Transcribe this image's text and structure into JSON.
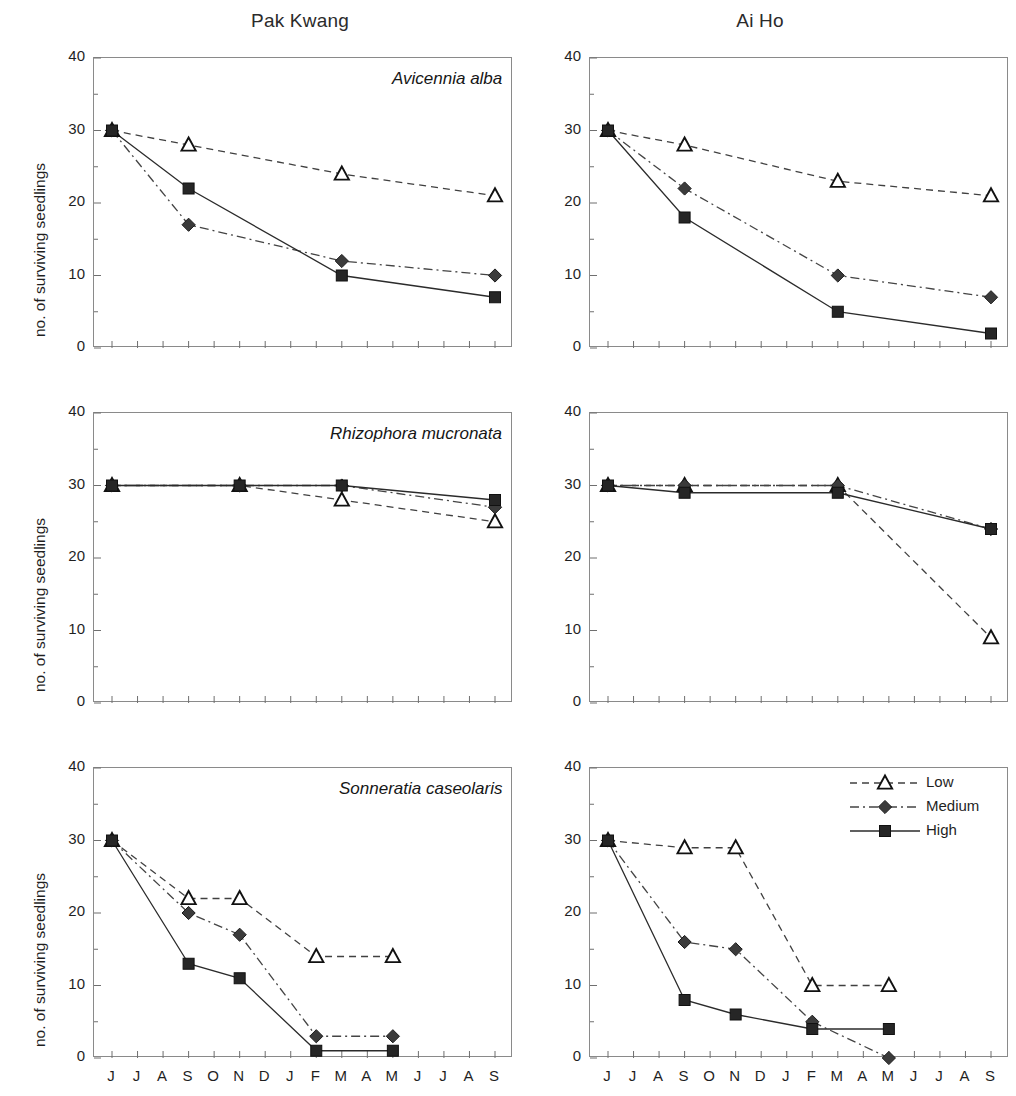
{
  "figure": {
    "ylabel": "no. of surviving seedlings",
    "columns": [
      {
        "key": "pak_kwang",
        "title": "Pak Kwang"
      },
      {
        "key": "ai_ho",
        "title": "Ai Ho"
      }
    ],
    "rows": [
      {
        "key": "avicennia",
        "species": "Avicennia alba"
      },
      {
        "key": "rhizophora",
        "species": "Rhizophora mucronata"
      },
      {
        "key": "sonneratia",
        "species": "Sonneratia caseolaris"
      }
    ],
    "y_ticks": [
      "0",
      "10",
      "20",
      "30",
      "40"
    ],
    "x_ticks": [
      "J",
      "J",
      "A",
      "S",
      "O",
      "N",
      "D",
      "J",
      "F",
      "M",
      "A",
      "M",
      "J",
      "J",
      "A",
      "S"
    ],
    "year_labels": [
      {
        "text": "1999",
        "month_index": 0
      },
      {
        "text": "2000",
        "month_index": 7
      }
    ],
    "legend": {
      "position": "top-right of bottom-right panel",
      "items": [
        {
          "label": "Low",
          "marker": "triangle-open",
          "line": "dashed",
          "color": "#3a3a3a"
        },
        {
          "label": "Medium",
          "marker": "diamond-filled",
          "line": "dash-dot",
          "color": "#3f3f3f"
        },
        {
          "label": "High",
          "marker": "square-filled",
          "line": "solid",
          "color": "#2a2a2a"
        }
      ]
    }
  },
  "chart_data": [
    {
      "type": "line",
      "id": "pak_kwang-avicennia",
      "title": "Avicennia alba",
      "panel_title": "Pak Kwang",
      "xlabel": "",
      "ylabel": "no. of surviving seedlings",
      "ylim": [
        0,
        40
      ],
      "yticks": [
        0,
        10,
        20,
        30,
        40
      ],
      "x": [
        "J",
        "J",
        "A",
        "S",
        "O",
        "N",
        "D",
        "J",
        "F",
        "M",
        "A",
        "M",
        "J",
        "J",
        "A",
        "S"
      ],
      "grid": false,
      "series": [
        {
          "name": "Low",
          "points": [
            {
              "x": 0,
              "y": 30
            },
            {
              "x": 3,
              "y": 28
            },
            {
              "x": 9,
              "y": 24
            },
            {
              "x": 15,
              "y": 21
            }
          ]
        },
        {
          "name": "Medium",
          "points": [
            {
              "x": 0,
              "y": 30
            },
            {
              "x": 3,
              "y": 17
            },
            {
              "x": 9,
              "y": 12
            },
            {
              "x": 15,
              "y": 10
            }
          ]
        },
        {
          "name": "High",
          "points": [
            {
              "x": 0,
              "y": 30
            },
            {
              "x": 3,
              "y": 22
            },
            {
              "x": 9,
              "y": 10
            },
            {
              "x": 15,
              "y": 7
            }
          ]
        }
      ]
    },
    {
      "type": "line",
      "id": "ai_ho-avicennia",
      "title": "",
      "panel_title": "Ai Ho",
      "xlabel": "",
      "ylabel": "no. of surviving seedlings",
      "ylim": [
        0,
        40
      ],
      "yticks": [
        0,
        10,
        20,
        30,
        40
      ],
      "x": [
        "J",
        "J",
        "A",
        "S",
        "O",
        "N",
        "D",
        "J",
        "F",
        "M",
        "A",
        "M",
        "J",
        "J",
        "A",
        "S"
      ],
      "grid": false,
      "series": [
        {
          "name": "Low",
          "points": [
            {
              "x": 0,
              "y": 30
            },
            {
              "x": 3,
              "y": 28
            },
            {
              "x": 9,
              "y": 23
            },
            {
              "x": 15,
              "y": 21
            }
          ]
        },
        {
          "name": "Medium",
          "points": [
            {
              "x": 0,
              "y": 30
            },
            {
              "x": 3,
              "y": 22
            },
            {
              "x": 9,
              "y": 10
            },
            {
              "x": 15,
              "y": 7
            }
          ]
        },
        {
          "name": "High",
          "points": [
            {
              "x": 0,
              "y": 30
            },
            {
              "x": 3,
              "y": 18
            },
            {
              "x": 9,
              "y": 5
            },
            {
              "x": 15,
              "y": 2
            }
          ]
        }
      ]
    },
    {
      "type": "line",
      "id": "pak_kwang-rhizophora",
      "title": "Rhizophora mucronata",
      "panel_title": "Pak Kwang",
      "xlabel": "",
      "ylabel": "no. of surviving seedlings",
      "ylim": [
        0,
        40
      ],
      "yticks": [
        0,
        10,
        20,
        30,
        40
      ],
      "x": [
        "J",
        "J",
        "A",
        "S",
        "O",
        "N",
        "D",
        "J",
        "F",
        "M",
        "A",
        "M",
        "J",
        "J",
        "A",
        "S"
      ],
      "grid": false,
      "series": [
        {
          "name": "Low",
          "points": [
            {
              "x": 0,
              "y": 30
            },
            {
              "x": 5,
              "y": 30
            },
            {
              "x": 9,
              "y": 28
            },
            {
              "x": 15,
              "y": 25
            }
          ]
        },
        {
          "name": "Medium",
          "points": [
            {
              "x": 0,
              "y": 30
            },
            {
              "x": 5,
              "y": 30
            },
            {
              "x": 9,
              "y": 30
            },
            {
              "x": 15,
              "y": 27
            }
          ]
        },
        {
          "name": "High",
          "points": [
            {
              "x": 0,
              "y": 30
            },
            {
              "x": 5,
              "y": 30
            },
            {
              "x": 9,
              "y": 30
            },
            {
              "x": 15,
              "y": 28
            }
          ]
        }
      ]
    },
    {
      "type": "line",
      "id": "ai_ho-rhizophora",
      "title": "",
      "panel_title": "Ai Ho",
      "xlabel": "",
      "ylabel": "no. of surviving seedlings",
      "ylim": [
        0,
        40
      ],
      "yticks": [
        0,
        10,
        20,
        30,
        40
      ],
      "x": [
        "J",
        "J",
        "A",
        "S",
        "O",
        "N",
        "D",
        "J",
        "F",
        "M",
        "A",
        "M",
        "J",
        "J",
        "A",
        "S"
      ],
      "grid": false,
      "series": [
        {
          "name": "Low",
          "points": [
            {
              "x": 0,
              "y": 30
            },
            {
              "x": 3,
              "y": 30
            },
            {
              "x": 9,
              "y": 30
            },
            {
              "x": 15,
              "y": 9
            }
          ]
        },
        {
          "name": "Medium",
          "points": [
            {
              "x": 0,
              "y": 30
            },
            {
              "x": 3,
              "y": 30
            },
            {
              "x": 9,
              "y": 30
            },
            {
              "x": 15,
              "y": 24
            }
          ]
        },
        {
          "name": "High",
          "points": [
            {
              "x": 0,
              "y": 30
            },
            {
              "x": 3,
              "y": 29
            },
            {
              "x": 9,
              "y": 29
            },
            {
              "x": 15,
              "y": 24
            }
          ]
        }
      ]
    },
    {
      "type": "line",
      "id": "pak_kwang-sonneratia",
      "title": "Sonneratia caseolaris",
      "panel_title": "Pak Kwang",
      "xlabel": "",
      "ylabel": "no. of surviving seedlings",
      "ylim": [
        0,
        40
      ],
      "yticks": [
        0,
        10,
        20,
        30,
        40
      ],
      "x": [
        "J",
        "J",
        "A",
        "S",
        "O",
        "N",
        "D",
        "J",
        "F",
        "M",
        "A",
        "M",
        "J",
        "J",
        "A",
        "S"
      ],
      "grid": false,
      "series": [
        {
          "name": "Low",
          "points": [
            {
              "x": 0,
              "y": 30
            },
            {
              "x": 3,
              "y": 22
            },
            {
              "x": 5,
              "y": 22
            },
            {
              "x": 8,
              "y": 14
            },
            {
              "x": 11,
              "y": 14
            }
          ]
        },
        {
          "name": "Medium",
          "points": [
            {
              "x": 0,
              "y": 30
            },
            {
              "x": 3,
              "y": 20
            },
            {
              "x": 5,
              "y": 17
            },
            {
              "x": 8,
              "y": 3
            },
            {
              "x": 11,
              "y": 3
            }
          ]
        },
        {
          "name": "High",
          "points": [
            {
              "x": 0,
              "y": 30
            },
            {
              "x": 3,
              "y": 13
            },
            {
              "x": 5,
              "y": 11
            },
            {
              "x": 8,
              "y": 1
            },
            {
              "x": 11,
              "y": 1
            }
          ]
        }
      ]
    },
    {
      "type": "line",
      "id": "ai_ho-sonneratia",
      "title": "",
      "panel_title": "Ai Ho",
      "xlabel": "",
      "ylabel": "no. of surviving seedlings",
      "ylim": [
        0,
        40
      ],
      "yticks": [
        0,
        10,
        20,
        30,
        40
      ],
      "x": [
        "J",
        "J",
        "A",
        "S",
        "O",
        "N",
        "D",
        "J",
        "F",
        "M",
        "A",
        "M",
        "J",
        "J",
        "A",
        "S"
      ],
      "grid": false,
      "series": [
        {
          "name": "Low",
          "points": [
            {
              "x": 0,
              "y": 30
            },
            {
              "x": 3,
              "y": 29
            },
            {
              "x": 5,
              "y": 29
            },
            {
              "x": 8,
              "y": 10
            },
            {
              "x": 11,
              "y": 10
            }
          ]
        },
        {
          "name": "Medium",
          "points": [
            {
              "x": 0,
              "y": 30
            },
            {
              "x": 3,
              "y": 16
            },
            {
              "x": 5,
              "y": 15
            },
            {
              "x": 8,
              "y": 5
            },
            {
              "x": 11,
              "y": 0
            }
          ]
        },
        {
          "name": "High",
          "points": [
            {
              "x": 0,
              "y": 30
            },
            {
              "x": 3,
              "y": 8
            },
            {
              "x": 5,
              "y": 6
            },
            {
              "x": 8,
              "y": 4
            },
            {
              "x": 11,
              "y": 4
            }
          ]
        }
      ]
    }
  ]
}
